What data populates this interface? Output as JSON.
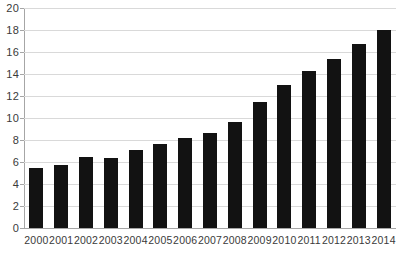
{
  "chart_data": {
    "type": "bar",
    "title": "",
    "subtitle": "",
    "xlabel": "",
    "ylabel": "",
    "categories": [
      "2000",
      "2001",
      "2002",
      "2003",
      "2004",
      "2005",
      "2006",
      "2007",
      "2008",
      "2009",
      "2010",
      "2011",
      "2012",
      "2013",
      "2014"
    ],
    "values": [
      5.5,
      5.7,
      6.5,
      6.4,
      7.1,
      7.6,
      8.2,
      8.6,
      9.6,
      11.5,
      13.0,
      14.3,
      15.4,
      16.7,
      18.0
    ],
    "ylim": [
      0,
      20
    ],
    "yticks": [
      0,
      2,
      4,
      6,
      8,
      10,
      12,
      14,
      16,
      18,
      20
    ],
    "ytick_labels": [
      "0",
      "2",
      "4",
      "6",
      "8",
      "10",
      "12",
      "14",
      "16",
      "18",
      "20"
    ],
    "grid": true,
    "grid_axis": "y",
    "legend": false,
    "legend_position": "none",
    "annotations": [],
    "bar_color": "#121212",
    "gridline_color": "#d9d9d9",
    "axis_color": "#a6a6a6",
    "label_color": "#3a3a3a",
    "background_color": "#ffffff"
  }
}
